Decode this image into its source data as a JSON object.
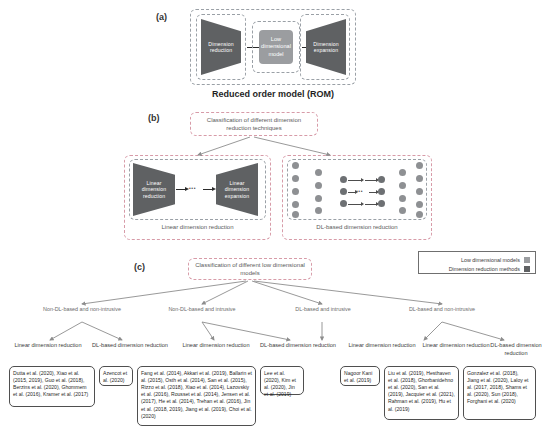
{
  "figure": {
    "panel_a": {
      "letter": "(a)",
      "left_block": "Dimension reduction",
      "center_block": "Low dimensional model",
      "right_block": "Dimension expansion",
      "caption": "Reduced order model (ROM)"
    },
    "panel_b": {
      "letter": "(b)",
      "root": "Classification of different dimension reduction techniques",
      "left_group": {
        "left_block": "Linear dimension reduction",
        "right_block": "Linear dimension expansion",
        "caption": "Linear dimension reduction"
      },
      "right_group": {
        "caption": "DL-based dimension reduction"
      }
    },
    "panel_c": {
      "letter": "(c)",
      "root": "Classification of different low dimensional models",
      "branches": [
        {
          "label": "Non-DL-based and non-intrusive",
          "leaves": [
            {
              "label": "Linear dimension reduction",
              "citations": "Dutta et al. (2020), Xiao et al. (2015, 2019), Guo et al. (2018), Berzins et al. (2020), Ghommem et al. (2016), Kramer et al. (2017)"
            },
            {
              "label": "DL-based dimension reduction",
              "citations": "Azencot et al. (2020)"
            }
          ]
        },
        {
          "label": "Non-DL-based and intrusive",
          "leaves": [
            {
              "label": "Linear dimension reduction",
              "citations": "Fang et al. (2014), Akkari et al. (2019), Ballarin et al. (2015), Osth et al. (2014), San et al. (2015), Rizzo et al. (2018), Xiao et al. (2014), Lazovskiy et al. (2016), Rousset et al. (2014), Jensen et al. (2017), He et al. (2014), Trehan et al. (2016), Jin et al. (2018, 2019), Jiang et al. (2019), Choi et al. (2020)"
            },
            {
              "label": "DL-based dimension reduction",
              "citations": "Lee et al. (2020), Kim et al. (2020), Jin et al. (2019)"
            }
          ]
        },
        {
          "label": "DL-based and intrusive",
          "leaves": [
            {
              "label": "Linear dimension reduction",
              "citations": "Nagoor Kani et al. (2019)"
            }
          ]
        },
        {
          "label": "DL-based and non-intrusive",
          "leaves": [
            {
              "label": "Linear dimension reduction",
              "citations": "Liu et al. (2019), Hesthaven et al. (2018), Ghorbanidehno et al. (2020), San et al. (2019), Jacquier et al. (2021), Rahman et al. (2019), Hu et al. (2019)"
            },
            {
              "label": "DL-based dimension reduction",
              "citations": "Gonzalez et al. (2018), Jiang et al. (2020), Laloy et al. (2017, 2018), Shams et al. (2020), Sun (2018), Forghani et al. (2020)"
            }
          ]
        }
      ]
    },
    "legend": {
      "items": [
        {
          "label": "Low dimensional models",
          "color": "#9b9da0"
        },
        {
          "label": "Dimension reduction methods",
          "color": "#5f6163"
        }
      ]
    }
  }
}
